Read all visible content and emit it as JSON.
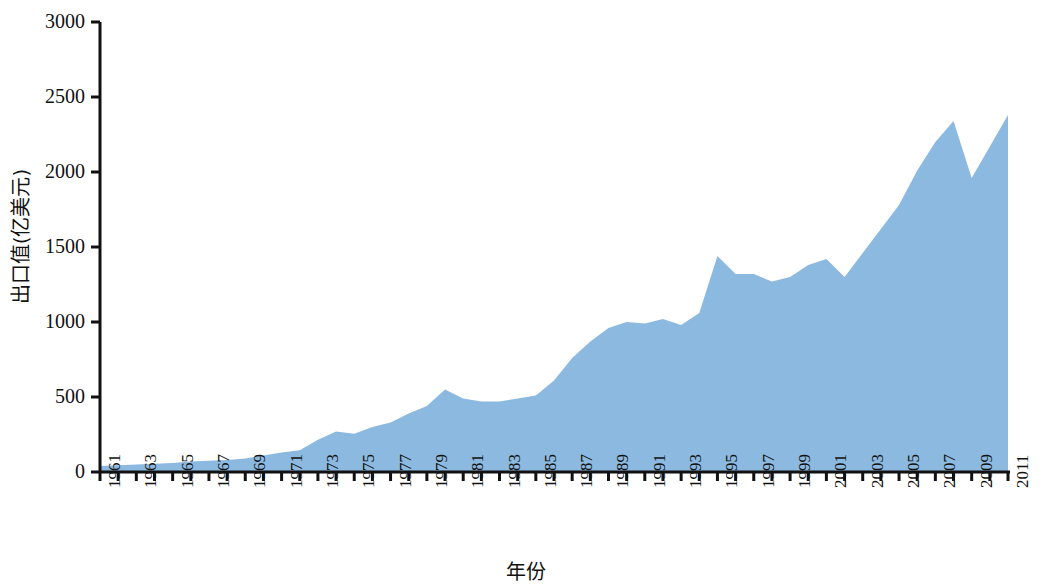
{
  "chart_data": {
    "type": "area",
    "title": "",
    "subtitle": "",
    "xlabel": "年份",
    "ylabel": "出口值(亿美元)",
    "ylim": [
      0,
      3000
    ],
    "xlim": [
      1961,
      2011
    ],
    "grid": false,
    "legend": null,
    "legend_position": "none",
    "fill_color": "#8cb9e0",
    "axis_color": "#111111",
    "y_ticks": [
      0,
      500,
      1000,
      1500,
      2000,
      2500,
      3000
    ],
    "y_tick_labels": [
      "0",
      "500",
      "1000",
      "1500",
      "2000",
      "2500",
      "3000"
    ],
    "x_tick_labels": [
      "1961",
      "1963",
      "1965",
      "1967",
      "1969",
      "1971",
      "1973",
      "1975",
      "1977",
      "1979",
      "1981",
      "1983",
      "1985",
      "1987",
      "1989",
      "1991",
      "1993",
      "1995",
      "1997",
      "1999",
      "2001",
      "2003",
      "2005",
      "2007",
      "2009",
      "2011"
    ],
    "x_minor_ticks_every_year": true,
    "categories": [
      1961,
      1962,
      1963,
      1964,
      1965,
      1966,
      1967,
      1968,
      1969,
      1970,
      1971,
      1972,
      1973,
      1974,
      1975,
      1976,
      1977,
      1978,
      1979,
      1980,
      1981,
      1982,
      1983,
      1984,
      1985,
      1986,
      1987,
      1988,
      1989,
      1990,
      1991,
      1992,
      1993,
      1994,
      1995,
      1996,
      1997,
      1998,
      1999,
      2000,
      2001,
      2002,
      2003,
      2004,
      2005,
      2006,
      2007,
      2008,
      2009,
      2010,
      2011
    ],
    "series": [
      {
        "name": "出口值(亿美元)",
        "values": [
          40,
          45,
          50,
          55,
          60,
          70,
          75,
          80,
          90,
          110,
          130,
          145,
          215,
          270,
          255,
          300,
          330,
          390,
          440,
          550,
          490,
          470,
          470,
          490,
          510,
          610,
          760,
          870,
          960,
          1000,
          990,
          1020,
          980,
          1060,
          1440,
          1320,
          1320,
          1270,
          1300,
          1380,
          1420,
          1300,
          1460,
          1620,
          1780,
          2010,
          2200,
          2340,
          1960,
          2170,
          2380
        ]
      }
    ]
  },
  "plot_geometry": {
    "left": 100,
    "right": 1008,
    "top": 22,
    "bottom": 472
  }
}
